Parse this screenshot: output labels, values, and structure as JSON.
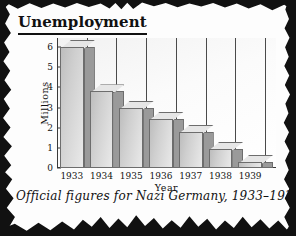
{
  "header": {
    "title": "Unemployment"
  },
  "caption": "Official figures for Nazi Germany, 1933–1939",
  "chart_data": {
    "type": "bar",
    "title": "Unemployment",
    "xlabel": "Year",
    "ylabel": "Millions",
    "categories": [
      "1933",
      "1934",
      "1935",
      "1936",
      "1937",
      "1938",
      "1939"
    ],
    "values": [
      6.0,
      3.8,
      3.0,
      2.45,
      1.8,
      0.95,
      0.3
    ],
    "ylim": [
      0,
      6
    ],
    "yticks": [
      "0",
      "1",
      "2",
      "3",
      "4",
      "5",
      "6"
    ],
    "grid": false,
    "legend": null,
    "style_3d": true,
    "annotations": "Official figures for Nazi Germany, 1933–1939"
  },
  "colors": {
    "border": "#111111",
    "bar_light": "#e9e9e9",
    "bar_dark": "#bdbdbd",
    "bar_side": "#9a9a9a",
    "bar_outline": "#6d6d6d",
    "axis": "#3a3a3a",
    "text": "#111111"
  }
}
